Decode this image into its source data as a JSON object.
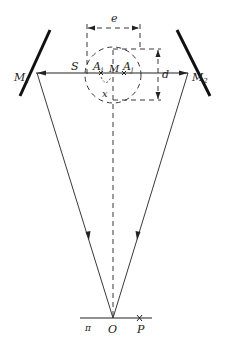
{
  "diagram": {
    "type": "optics-interferometer",
    "labels": {
      "mirror_left": "M",
      "mirror_left_sub": "1",
      "mirror_right": "M",
      "mirror_right_sub": "2",
      "source": "S",
      "point_i": "A",
      "point_i_sub": "i",
      "point_j": "A",
      "point_j_sub": "j",
      "midpoint": "M",
      "width_e": "e",
      "height_d": "d",
      "offset_x": "x",
      "origin": "O",
      "point_p": "P",
      "screen": "π"
    },
    "colors": {
      "line": "#222222",
      "mirror": "#111111",
      "background": "#ffffff"
    }
  }
}
